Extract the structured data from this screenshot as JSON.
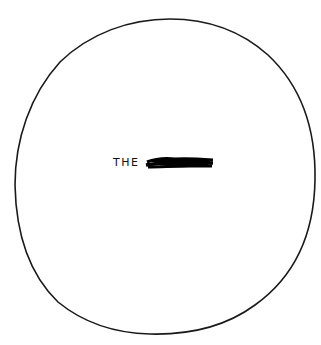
{
  "drawing": {
    "shape": "hand-drawn circle",
    "stroke_color": "#1a1a1a",
    "background": "#ffffff",
    "text": "THE",
    "redaction": "scribbled-out word"
  }
}
